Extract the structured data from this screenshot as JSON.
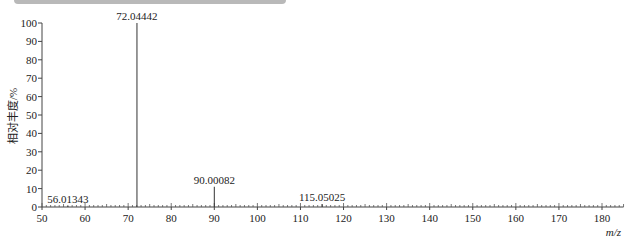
{
  "chart_data": {
    "type": "bar",
    "subtype": "mass-spectrum-stick",
    "title": "",
    "xlabel": "m/z",
    "ylabel": "相对丰度/%",
    "xlim": [
      50,
      185
    ],
    "ylim": [
      0,
      100
    ],
    "x_ticks": [
      50,
      60,
      70,
      80,
      90,
      100,
      110,
      120,
      130,
      140,
      150,
      160,
      170,
      180
    ],
    "y_ticks": [
      0,
      10,
      20,
      30,
      40,
      50,
      60,
      70,
      80,
      90,
      100
    ],
    "grid": false,
    "legend": null,
    "peaks": [
      {
        "mz": 56.01343,
        "label": "56.01343",
        "intensity": 0.5
      },
      {
        "mz": 72.04442,
        "label": "72.04442",
        "intensity": 100
      },
      {
        "mz": 90.00082,
        "label": "90.00082",
        "intensity": 11
      },
      {
        "mz": 115.05025,
        "label": "115.05025",
        "intensity": 1.5
      }
    ]
  }
}
